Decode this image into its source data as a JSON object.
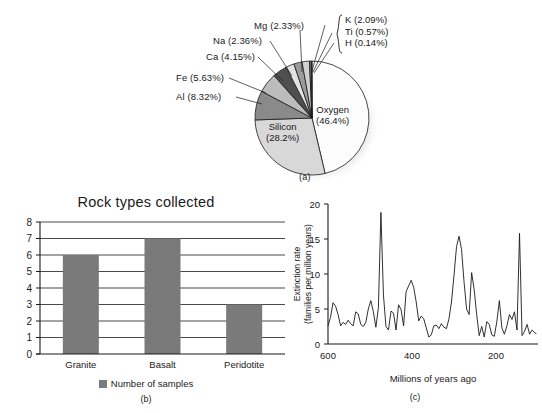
{
  "figure": {
    "panels": [
      {
        "id": "a",
        "caption": "(a)"
      },
      {
        "id": "b",
        "caption": "(b)"
      },
      {
        "id": "c",
        "caption": "(c)"
      }
    ]
  },
  "chart_data": [
    {
      "type": "pie",
      "panel": "(a)",
      "title": "",
      "labels": [
        "Oxygen (46.4%)",
        "Silicon (28.2%)",
        "Al (8.32%)",
        "Fe (5.63%)",
        "Ca (4.15%)",
        "Na (2.36%)",
        "Mg (2.33%)",
        "K (2.09%)",
        "Ti (0.57%)",
        "H (0.14%)"
      ],
      "slices": [
        {
          "name": "Oxygen",
          "value": 46.4,
          "label": "Oxygen",
          "pct_text": "(46.4%)",
          "color": "#fdfdfd",
          "inside": true
        },
        {
          "name": "Silicon",
          "value": 28.2,
          "label": "Silicon",
          "pct_text": "(28.2%)",
          "color": "#d8d8d8",
          "inside": true
        },
        {
          "name": "Al",
          "value": 8.32,
          "label": "Al (8.32%)",
          "color": "#8a8a8a",
          "inside": false
        },
        {
          "name": "Fe",
          "value": 5.63,
          "label": "Fe (5.63%)",
          "color": "#bcbcbc",
          "inside": false
        },
        {
          "name": "Ca",
          "value": 4.15,
          "label": "Ca (4.15%)",
          "color": "#4f4f4f",
          "inside": false
        },
        {
          "name": "Na",
          "value": 2.36,
          "label": "Na (2.36%)",
          "color": "#e2e2e2",
          "inside": false
        },
        {
          "name": "Mg",
          "value": 2.33,
          "label": "Mg (2.33%)",
          "color": "#9b9b9b",
          "inside": false
        },
        {
          "name": "K",
          "value": 2.09,
          "label": "K (2.09%)",
          "color": "#d0d0d0",
          "inside": false
        },
        {
          "name": "Ti",
          "value": 0.57,
          "label": "Ti (0.57%)",
          "color": "#6e6e6e",
          "inside": false
        },
        {
          "name": "H",
          "value": 0.14,
          "label": "H (0.14%)",
          "color": "#a8a8a8",
          "inside": false
        }
      ],
      "legend_position": "callout-labels",
      "units": "percent by mass"
    },
    {
      "type": "bar",
      "panel": "(b)",
      "title": "Rock types collected",
      "categories": [
        "Granite",
        "Basalt",
        "Peridotite"
      ],
      "values": [
        6,
        7,
        3
      ],
      "series_name": "Number of samples",
      "xlabel": "",
      "ylabel": "",
      "ylim": [
        0,
        8
      ],
      "yticks": [
        0,
        1,
        2,
        3,
        4,
        5,
        6,
        7,
        8
      ],
      "grid": true,
      "bar_color": "#7a7a7a",
      "legend_position": "bottom"
    },
    {
      "type": "line",
      "panel": "(c)",
      "title": "",
      "xlabel": "Millions of years ago",
      "ylabel_line1": "Extinction rate",
      "ylabel_line2": "(families per million years)",
      "xlim": [
        600,
        100
      ],
      "ylim": [
        0,
        20
      ],
      "xticks": [
        600,
        400,
        200
      ],
      "yticks": [
        0,
        5,
        10,
        15,
        20
      ],
      "x_reversed": true,
      "grid": false,
      "line_color": "#1a1a1a",
      "x": [
        600,
        594,
        588,
        582,
        576,
        570,
        564,
        558,
        552,
        546,
        540,
        534,
        528,
        522,
        516,
        510,
        504,
        498,
        492,
        486,
        480,
        474,
        468,
        462,
        456,
        450,
        444,
        438,
        432,
        426,
        420,
        414,
        408,
        402,
        396,
        390,
        384,
        378,
        372,
        366,
        360,
        354,
        348,
        342,
        336,
        330,
        324,
        318,
        312,
        306,
        300,
        294,
        288,
        282,
        276,
        270,
        264,
        258,
        252,
        246,
        240,
        234,
        228,
        222,
        216,
        210,
        204,
        198,
        192,
        186,
        180,
        174,
        168,
        162,
        156,
        150,
        144,
        138,
        132,
        126,
        120,
        114,
        108,
        104
      ],
      "y": [
        2.6,
        3.8,
        5.9,
        5.4,
        4.2,
        2.6,
        3.1,
        2.8,
        3.4,
        2.9,
        2.6,
        4.6,
        4.3,
        2.8,
        2.5,
        3.1,
        5.0,
        6.2,
        4.6,
        2.4,
        5.2,
        18.8,
        7.0,
        2.5,
        2.0,
        4.7,
        4.4,
        2.0,
        5.6,
        4.9,
        2.6,
        7.5,
        8.3,
        9.1,
        8.1,
        6.0,
        3.3,
        4.0,
        3.6,
        2.3,
        1.0,
        1.3,
        2.6,
        2.7,
        2.2,
        2.9,
        2.4,
        2.2,
        3.6,
        6.0,
        9.8,
        13.9,
        15.4,
        13.5,
        8.8,
        5.0,
        4.2,
        10.2,
        7.8,
        4.2,
        1.2,
        2.5,
        1.0,
        3.2,
        2.8,
        1.3,
        1.1,
        3.2,
        6.2,
        2.3,
        1.4,
        2.6,
        4.2,
        3.5,
        4.6,
        2.0,
        15.8,
        1.2,
        1.8,
        2.8,
        1.4,
        2.0,
        1.6,
        1.5
      ]
    }
  ],
  "pie": {
    "inner_labels": [
      {
        "name": "oxygen",
        "line1": "Oxygen",
        "line2": "(46.4%)"
      },
      {
        "name": "silicon",
        "line1": "Silicon",
        "line2": "(28.2%)"
      }
    ],
    "callouts": [
      {
        "name": "al",
        "text": "Al (8.32%)"
      },
      {
        "name": "fe",
        "text": "Fe (5.63%)"
      },
      {
        "name": "ca",
        "text": "Ca (4.15%)"
      },
      {
        "name": "na",
        "text": "Na (2.36%)"
      },
      {
        "name": "mg",
        "text": "Mg (2.33%)"
      }
    ],
    "brace": [
      {
        "name": "k",
        "text": "K (2.09%)"
      },
      {
        "name": "ti",
        "text": "Ti (0.57%)"
      },
      {
        "name": "h",
        "text": "H (0.14%)"
      }
    ],
    "caption": "(a)"
  },
  "bar": {
    "title": "Rock types collected",
    "yticks": [
      "8",
      "7",
      "6",
      "5",
      "4",
      "3",
      "2",
      "1",
      "0"
    ],
    "categories": [
      "Granite",
      "Basalt",
      "Peridotite"
    ],
    "legend_label": "Number of samples",
    "caption": "(b)"
  },
  "line": {
    "yticks": [
      "20",
      "15",
      "10",
      "5",
      "0"
    ],
    "xticks": [
      "600",
      "400",
      "200"
    ],
    "ylabel_line1": "Extinction rate",
    "ylabel_line2": "(families per million years)",
    "xlabel": "Millions of years ago",
    "caption": "(c)"
  }
}
